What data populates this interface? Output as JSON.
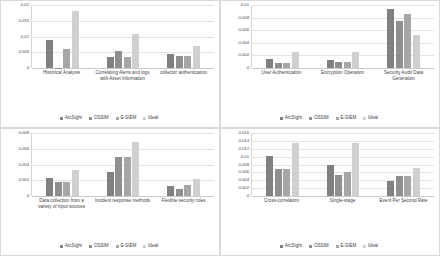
{
  "figure": {
    "series_names": [
      "ArcSight",
      "OSSIM",
      "E-SIEM",
      "Ideal"
    ],
    "series_colors": [
      "#808080",
      "#8f8f8f",
      "#a6a6a6",
      "#cfcfcf"
    ],
    "legend_position": "bottom",
    "grid": true
  },
  "chart_data": [
    {
      "type": "bar",
      "title": "",
      "xlabel": "",
      "ylabel": "",
      "grid": true,
      "legend": "bottom",
      "ylim": [
        0,
        0.02
      ],
      "yticks": [
        0,
        0.005,
        0.01,
        0.015,
        0.02
      ],
      "ytick_labels": [
        "0",
        "0.005",
        "0.01",
        "0.015",
        "0.02"
      ],
      "categories": [
        "Historical Analysis",
        "Correlating Alerts and logs with Asset Information",
        "collector authentication"
      ],
      "series": [
        {
          "name": "ArcSight",
          "values": [
            0.009,
            0.0035,
            0.0046
          ]
        },
        {
          "name": "OSSIM",
          "values": [
            0.0,
            0.0055,
            0.0037
          ]
        },
        {
          "name": "E-SIEM",
          "values": [
            0.006,
            0.0036,
            0.0037
          ]
        },
        {
          "name": "Ideal",
          "values": [
            0.018,
            0.0108,
            0.007
          ]
        }
      ]
    },
    {
      "type": "bar",
      "title": "",
      "xlabel": "",
      "ylabel": "",
      "grid": true,
      "legend": "bottom",
      "ylim": [
        0,
        0.01
      ],
      "yticks": [
        0,
        0.002,
        0.004,
        0.006,
        0.008,
        0.01
      ],
      "ytick_labels": [
        "0",
        "0.002",
        "0.004",
        "0.006",
        "0.008",
        "0.01"
      ],
      "categories": [
        "User Authentication",
        "Encryption Operation",
        "Security Audit Data Generation"
      ],
      "series": [
        {
          "name": "ArcSight",
          "values": [
            0.0015,
            0.0012,
            0.0093
          ]
        },
        {
          "name": "OSSIM",
          "values": [
            0.0008,
            0.0009,
            0.0075
          ]
        },
        {
          "name": "E-SIEM",
          "values": [
            0.0008,
            0.0009,
            0.0086
          ]
        },
        {
          "name": "Ideal",
          "values": [
            0.0025,
            0.0025,
            0.0052
          ]
        }
      ]
    },
    {
      "type": "bar",
      "title": "",
      "xlabel": "",
      "ylabel": "",
      "grid": true,
      "legend": "bottom",
      "ylim": [
        0,
        0.008
      ],
      "yticks": [
        0,
        0.002,
        0.004,
        0.006,
        0.008
      ],
      "ytick_labels": [
        "0",
        "0.002",
        "0.004",
        "0.006",
        "0.008"
      ],
      "categories": [
        "Data collection from a variety of input sources",
        "Incident response methods",
        "Flexible security roles"
      ],
      "series": [
        {
          "name": "ArcSight",
          "values": [
            0.0023,
            0.003,
            0.0013
          ]
        },
        {
          "name": "OSSIM",
          "values": [
            0.0018,
            0.005,
            0.0009
          ]
        },
        {
          "name": "E-SIEM",
          "values": [
            0.0018,
            0.005,
            0.0014
          ]
        },
        {
          "name": "Ideal",
          "values": [
            0.0033,
            0.0069,
            0.0022
          ]
        }
      ]
    },
    {
      "type": "bar",
      "title": "",
      "xlabel": "",
      "ylabel": "",
      "grid": true,
      "legend": "bottom",
      "ylim": [
        0,
        0.016
      ],
      "yticks": [
        0,
        0.002,
        0.004,
        0.006,
        0.008,
        0.01,
        0.012,
        0.014,
        0.016
      ],
      "ytick_labels": [
        "0",
        "0.002",
        "0.004",
        "0.006",
        "0.008",
        "0.01",
        "0.012",
        "0.014",
        "0.016"
      ],
      "categories": [
        "Cross-correlation",
        "Single-stage",
        "Event Per Second Rate"
      ],
      "series": [
        {
          "name": "ArcSight",
          "values": [
            0.0101,
            0.0078,
            0.0037
          ]
        },
        {
          "name": "OSSIM",
          "values": [
            0.0068,
            0.0053,
            0.005
          ]
        },
        {
          "name": "E-SIEM",
          "values": [
            0.0068,
            0.006,
            0.005
          ]
        },
        {
          "name": "Ideal",
          "values": [
            0.0135,
            0.0135,
            0.0072
          ]
        }
      ]
    }
  ]
}
